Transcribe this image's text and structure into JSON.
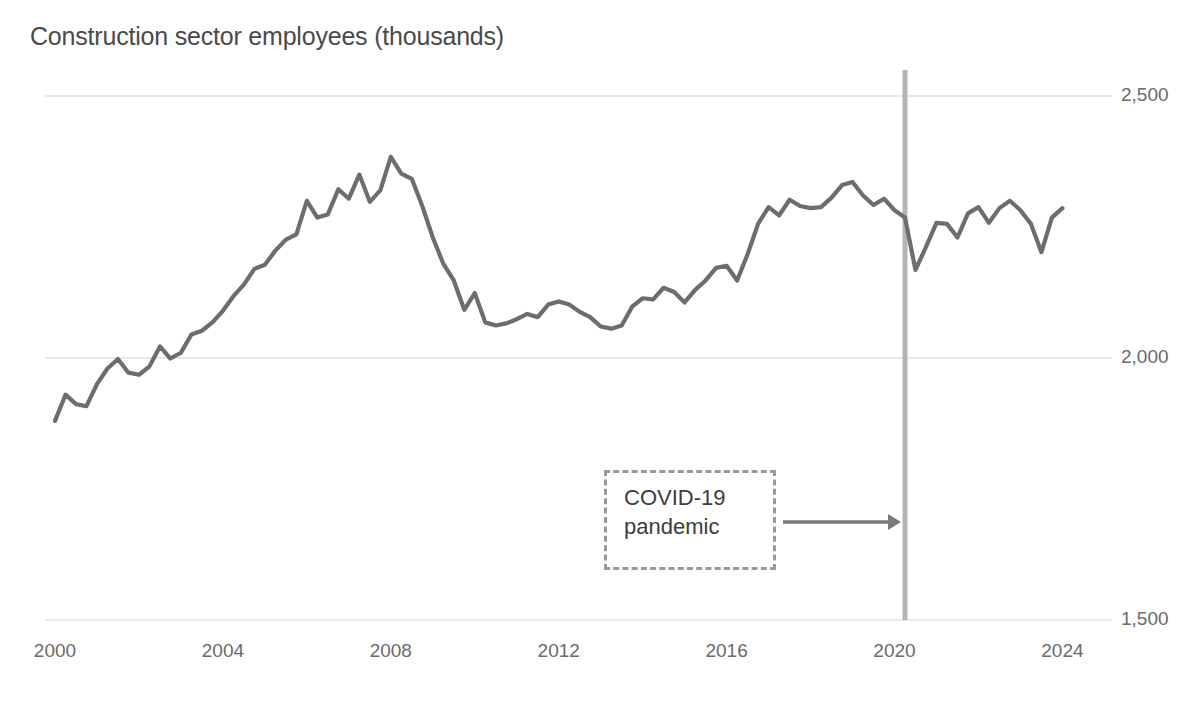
{
  "chart_data": {
    "type": "line",
    "title": "Construction sector employees (thousands)",
    "xlabel": "",
    "ylabel": "",
    "ylim": [
      1500,
      2500
    ],
    "xlim": [
      2000,
      2024.3
    ],
    "grid": true,
    "gridlines_y": [
      1500,
      2000,
      2500
    ],
    "legend": null,
    "legend_position": "none",
    "ytick_labels": [
      "2,500",
      "2,000",
      "1,500"
    ],
    "ytick_values": [
      2500,
      2000,
      1500
    ],
    "xtick_labels": [
      "2000",
      "2004",
      "2008",
      "2012",
      "2016",
      "2020",
      "2024"
    ],
    "xtick_values": [
      2000,
      2004,
      2008,
      2012,
      2016,
      2020,
      2024
    ],
    "series_name": "Construction sector employees",
    "line_color": "#6d6d6d",
    "annotations": [
      {
        "text": "COVID-19\npandemic",
        "type": "dashed-box-with-arrow",
        "points_to_x": 2020.25,
        "box_border_color": "#9a9a9a",
        "arrow_color": "#7a7a7a"
      }
    ],
    "vertical_markers": [
      {
        "x": 2020.25,
        "label": "COVID-19 pandemic",
        "color": "#b4b4b4"
      }
    ],
    "x": [
      2000.0,
      2000.25,
      2000.5,
      2000.75,
      2001.0,
      2001.25,
      2001.5,
      2001.75,
      2002.0,
      2002.25,
      2002.5,
      2002.75,
      2003.0,
      2003.25,
      2003.5,
      2003.75,
      2004.0,
      2004.25,
      2004.5,
      2004.75,
      2005.0,
      2005.25,
      2005.5,
      2005.75,
      2006.0,
      2006.25,
      2006.5,
      2006.75,
      2007.0,
      2007.25,
      2007.5,
      2007.75,
      2008.0,
      2008.25,
      2008.5,
      2008.75,
      2009.0,
      2009.25,
      2009.5,
      2009.75,
      2010.0,
      2010.25,
      2010.5,
      2010.75,
      2011.0,
      2011.25,
      2011.5,
      2011.75,
      2012.0,
      2012.25,
      2012.5,
      2012.75,
      2013.0,
      2013.25,
      2013.5,
      2013.75,
      2014.0,
      2014.25,
      2014.5,
      2014.75,
      2015.0,
      2015.25,
      2015.5,
      2015.75,
      2016.0,
      2016.25,
      2016.5,
      2016.75,
      2017.0,
      2017.25,
      2017.5,
      2017.75,
      2018.0,
      2018.25,
      2018.5,
      2018.75,
      2019.0,
      2019.25,
      2019.5,
      2019.75,
      2020.0,
      2020.25,
      2020.5,
      2020.75,
      2021.0,
      2021.25,
      2021.5,
      2021.75,
      2022.0,
      2022.25,
      2022.5,
      2022.75,
      2023.0,
      2023.25,
      2023.5,
      2023.75,
      2024.0
    ],
    "values": [
      1880,
      1930,
      1912,
      1908,
      1950,
      1980,
      1998,
      1972,
      1968,
      1984,
      2022,
      1999,
      2010,
      2045,
      2052,
      2068,
      2090,
      2118,
      2140,
      2170,
      2178,
      2205,
      2226,
      2236,
      2300,
      2268,
      2274,
      2322,
      2304,
      2350,
      2298,
      2320,
      2384,
      2352,
      2342,
      2290,
      2230,
      2180,
      2148,
      2092,
      2124,
      2068,
      2062,
      2066,
      2074,
      2084,
      2078,
      2102,
      2108,
      2102,
      2088,
      2078,
      2060,
      2056,
      2062,
      2098,
      2114,
      2112,
      2134,
      2126,
      2106,
      2130,
      2148,
      2172,
      2176,
      2148,
      2198,
      2256,
      2288,
      2272,
      2302,
      2290,
      2286,
      2288,
      2306,
      2330,
      2336,
      2310,
      2292,
      2304,
      2282,
      2268,
      2168,
      2212,
      2258,
      2256,
      2230,
      2276,
      2288,
      2258,
      2286,
      2300,
      2282,
      2256,
      2202,
      2268,
      2286
    ]
  }
}
